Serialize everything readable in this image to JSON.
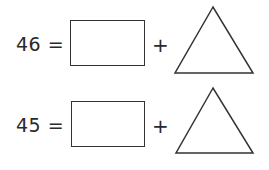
{
  "equations": [
    {
      "number": "46",
      "equals": "=",
      "plus": "+",
      "box_placeholder": "",
      "triangle_placeholder": ""
    },
    {
      "number": "45",
      "equals": "=",
      "plus": "+",
      "box_placeholder": "",
      "triangle_placeholder": ""
    }
  ],
  "colors": {
    "stroke": "#333333",
    "text": "#2a2a2a",
    "background": "#ffffff"
  }
}
